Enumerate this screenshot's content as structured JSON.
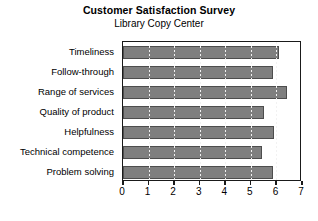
{
  "chart_data": {
    "type": "bar",
    "orientation": "horizontal",
    "title": "Customer Satisfaction Survey",
    "subtitle": "Library Copy Center",
    "xlabel": "",
    "ylabel": "",
    "xlim": [
      0,
      7
    ],
    "xticks": [
      "0",
      "1",
      "2",
      "3",
      "4",
      "5",
      "6",
      "7"
    ],
    "xtick_values": [
      0,
      1,
      2,
      3,
      4,
      5,
      6,
      7
    ],
    "grid": true,
    "grid_axis": "x",
    "grid_style": "dotted",
    "legend": false,
    "categories": [
      "Timeliness",
      "Follow-through",
      "Range of services",
      "Quality of product",
      "Helpfulness",
      "Technical competence",
      "Problem solving"
    ],
    "values": [
      6.1,
      5.85,
      6.4,
      5.5,
      5.9,
      5.45,
      5.85
    ],
    "bar_color": "#7f7f7f",
    "bar_edge_color": "#4d4d4d",
    "frame_color": "#1a1a1a",
    "background": "#ffffff"
  }
}
